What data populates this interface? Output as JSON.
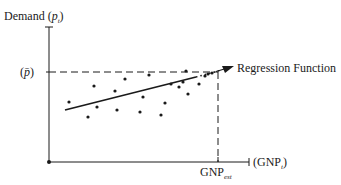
{
  "y_axis": {
    "label": "Demand",
    "symbol": "p",
    "subscript": "t"
  },
  "x_axis": {
    "label": "GNP",
    "subscript": "t"
  },
  "p_bar": {
    "label": "p̄"
  },
  "gnp_est": {
    "label": "GNP",
    "subscript": "est"
  },
  "regression": {
    "label": "Regression Function"
  },
  "points": [
    [
      69,
      102
    ],
    [
      88,
      117
    ],
    [
      94,
      86
    ],
    [
      97,
      107
    ],
    [
      115,
      91
    ],
    [
      117,
      110
    ],
    [
      125,
      79
    ],
    [
      140,
      112
    ],
    [
      143,
      97
    ],
    [
      149,
      75
    ],
    [
      161,
      115
    ],
    [
      165,
      103
    ],
    [
      171,
      84
    ],
    [
      186,
      71
    ],
    [
      179,
      87
    ],
    [
      183,
      82
    ],
    [
      188,
      94
    ],
    [
      199,
      84
    ],
    [
      205,
      76
    ],
    [
      208,
      74
    ],
    [
      212,
      73
    ]
  ],
  "colors": {
    "ink": "#1a1a1a",
    "background": "#ffffff"
  }
}
